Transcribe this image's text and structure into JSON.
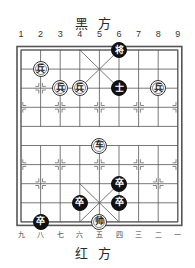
{
  "titles": {
    "black_side": "黑方",
    "red_side": "红方"
  },
  "files": {
    "top_labels": [
      "1",
      "2",
      "3",
      "4",
      "5",
      "6",
      "7",
      "8",
      "9"
    ],
    "bottom_labels": [
      "九",
      "八",
      "七",
      "六",
      "五",
      "四",
      "三",
      "二",
      "一"
    ]
  },
  "board": {
    "origin_x": 21,
    "origin_y": 50,
    "file_spacing": 19.6,
    "rank_spacing": 19.1,
    "line_color": "#555555",
    "frame_color": "#555555",
    "river_text": ""
  },
  "pieces": [
    {
      "name": "black-general",
      "char": "将",
      "side": "black",
      "file": 6,
      "rank": 0
    },
    {
      "name": "red-soldier",
      "char": "兵",
      "side": "red",
      "file": 2,
      "rank": 1
    },
    {
      "name": "red-soldier",
      "char": "兵",
      "side": "red",
      "file": 3,
      "rank": 2
    },
    {
      "name": "red-soldier",
      "char": "兵",
      "side": "red",
      "file": 4,
      "rank": 2
    },
    {
      "name": "black-advisor",
      "char": "士",
      "side": "black",
      "file": 6,
      "rank": 2
    },
    {
      "name": "red-soldier",
      "char": "兵",
      "side": "red",
      "file": 8,
      "rank": 2
    },
    {
      "name": "red-chariot",
      "char": "车",
      "side": "red",
      "file": 5,
      "rank": 5
    },
    {
      "name": "black-soldier",
      "char": "卒",
      "side": "black",
      "file": 6,
      "rank": 7
    },
    {
      "name": "black-soldier",
      "char": "卒",
      "side": "black",
      "file": 4,
      "rank": 8
    },
    {
      "name": "black-soldier",
      "char": "卒",
      "side": "black",
      "file": 6,
      "rank": 8
    },
    {
      "name": "red-marshal",
      "char": "帅",
      "side": "red",
      "file": 5,
      "rank": 9
    },
    {
      "name": "black-soldier",
      "char": "卒",
      "side": "black",
      "file": 2,
      "rank": 9
    }
  ]
}
